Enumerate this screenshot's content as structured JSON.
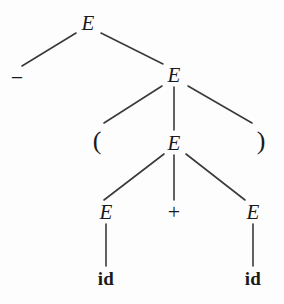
{
  "figure": {
    "kind": "parse-tree",
    "caption": "",
    "background_color": "#fdfdfd",
    "ink_color": "#1a1a1a",
    "edge_color": "#3a3a3a",
    "width": 284,
    "height": 304
  },
  "tree": {
    "nodes": [
      {
        "id": "e-root",
        "label": "E",
        "type": "nonterminal",
        "x": 88,
        "y": 23,
        "class": "nonterminal"
      },
      {
        "id": "t-minus",
        "label": "−",
        "type": "terminal",
        "x": 17,
        "y": 78,
        "class": "terminal-op"
      },
      {
        "id": "e-level2",
        "label": "E",
        "type": "nonterminal",
        "x": 174,
        "y": 75,
        "class": "nonterminal"
      },
      {
        "id": "t-lparen",
        "label": "(",
        "type": "terminal",
        "x": 97,
        "y": 141,
        "class": "terminal-paren"
      },
      {
        "id": "e-level3",
        "label": "E",
        "type": "nonterminal",
        "x": 174,
        "y": 143,
        "class": "nonterminal"
      },
      {
        "id": "t-rparen",
        "label": ")",
        "type": "terminal",
        "x": 261,
        "y": 141,
        "class": "terminal-paren"
      },
      {
        "id": "e-left-leaf",
        "label": "E",
        "type": "nonterminal",
        "x": 106,
        "y": 212,
        "class": "nonterminal"
      },
      {
        "id": "t-plus",
        "label": "+",
        "type": "terminal",
        "x": 174,
        "y": 212,
        "class": "terminal-op"
      },
      {
        "id": "e-right-leaf",
        "label": "E",
        "type": "nonterminal",
        "x": 253,
        "y": 212,
        "class": "nonterminal"
      },
      {
        "id": "t-id-left",
        "label": "id",
        "type": "terminal",
        "x": 106,
        "y": 278,
        "class": "terminal-id"
      },
      {
        "id": "t-id-right",
        "label": "id",
        "type": "terminal",
        "x": 253,
        "y": 278,
        "class": "terminal-id"
      }
    ],
    "edges": [
      {
        "id": "edge-root-minus",
        "from": "e-root",
        "to": "t-minus",
        "x1": 76,
        "y1": 33,
        "x2": 22,
        "y2": 66
      },
      {
        "id": "edge-root-e2",
        "from": "e-root",
        "to": "e-level2",
        "x1": 101,
        "y1": 33,
        "x2": 163,
        "y2": 64
      },
      {
        "id": "edge-e2-lparen",
        "from": "e-level2",
        "to": "t-lparen",
        "x1": 162,
        "y1": 86,
        "x2": 104,
        "y2": 123
      },
      {
        "id": "edge-e2-e3",
        "from": "e-level2",
        "to": "e-level3",
        "x1": 174,
        "y1": 87,
        "x2": 174,
        "y2": 130
      },
      {
        "id": "edge-e2-rparen",
        "from": "e-level2",
        "to": "t-rparen",
        "x1": 188,
        "y1": 86,
        "x2": 252,
        "y2": 123
      },
      {
        "id": "edge-e3-eleft",
        "from": "e-level3",
        "to": "e-left-leaf",
        "x1": 164,
        "y1": 154,
        "x2": 104,
        "y2": 200
      },
      {
        "id": "edge-e3-plus",
        "from": "e-level3",
        "to": "t-plus",
        "x1": 174,
        "y1": 155,
        "x2": 174,
        "y2": 200
      },
      {
        "id": "edge-e3-eright",
        "from": "e-level3",
        "to": "e-right-leaf",
        "x1": 186,
        "y1": 154,
        "x2": 245,
        "y2": 200
      },
      {
        "id": "edge-eleft-idleft",
        "from": "e-left-leaf",
        "to": "t-id-left",
        "x1": 106,
        "y1": 224,
        "x2": 106,
        "y2": 266
      },
      {
        "id": "edge-eright-idright",
        "from": "e-right-leaf",
        "to": "t-id-right",
        "x1": 253,
        "y1": 224,
        "x2": 253,
        "y2": 266
      }
    ]
  }
}
